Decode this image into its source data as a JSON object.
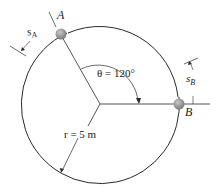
{
  "labels": {
    "point_a": "A",
    "point_b": "B",
    "s_a": "s",
    "s_a_sub": "A",
    "s_b": "s",
    "s_b_sub": "B",
    "theta": "θ = 120°",
    "radius": "r = 5 m"
  },
  "geometry": {
    "center": [
      100,
      104
    ],
    "radius_px": 79,
    "theta_deg": 120,
    "radius_value": "5 m"
  },
  "colors": {
    "line": "#2a2a2a",
    "ball": "#8c8c8c"
  }
}
